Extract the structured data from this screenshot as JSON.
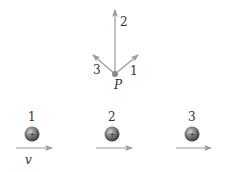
{
  "diagram": {
    "point": {
      "label": "P",
      "x": 115,
      "y": 74
    },
    "field_arrows": [
      {
        "label": "1",
        "direction": "up-right"
      },
      {
        "label": "2",
        "direction": "up"
      },
      {
        "label": "3",
        "direction": "up-left"
      }
    ],
    "charges": [
      {
        "label": "1",
        "sign": "+"
      },
      {
        "label": "2",
        "sign": "+"
      },
      {
        "label": "3",
        "sign": "+"
      }
    ],
    "velocity_label": "v",
    "colors": {
      "arrow": "#9a9a9a",
      "charge_dark": "#4a4a4a",
      "charge_light": "#bdbdbd",
      "text": "#333333"
    }
  }
}
